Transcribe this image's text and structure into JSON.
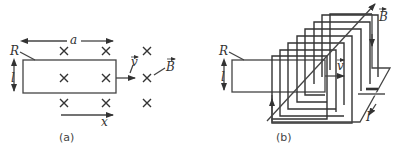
{
  "figure": {
    "panel_a": {
      "caption": "(a)",
      "labels": {
        "width": "a",
        "resistor": "R",
        "height": "l",
        "velocity": "v",
        "field": "B",
        "position": "x"
      },
      "field_marks": "×",
      "field_grid": {
        "rows": 3,
        "cols": 3
      }
    },
    "panel_b": {
      "caption": "(b)",
      "labels": {
        "resistor": "R",
        "height": "l",
        "velocity": "v",
        "field": "B",
        "current": "I"
      },
      "coil_turns": 8
    },
    "colors": {
      "line": "#444444",
      "background": "#ffffff"
    }
  }
}
